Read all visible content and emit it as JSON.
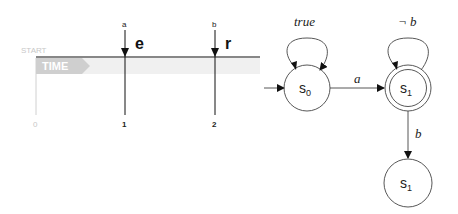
{
  "timeline": {
    "start_label": "START",
    "time_label": "TIME",
    "ticks": [
      {
        "label": "0",
        "x": 35
      },
      {
        "label": "1",
        "x": 125
      },
      {
        "label": "2",
        "x": 215
      }
    ],
    "events": [
      {
        "input": "a",
        "symbol": "e",
        "x": 125
      },
      {
        "input": "b",
        "symbol": "r",
        "x": 215
      }
    ],
    "colors": {
      "axis": "#111111",
      "faded": "#c8c8c8",
      "band": "#eeeeee"
    }
  },
  "automaton": {
    "states": [
      {
        "id": "s0",
        "label": "s",
        "sub": "0",
        "accepting": false,
        "initial": true
      },
      {
        "id": "s1",
        "label": "s",
        "sub": "1",
        "accepting": true,
        "initial": false
      },
      {
        "id": "s1b",
        "label": "s",
        "sub": "1",
        "accepting": false,
        "initial": false
      }
    ],
    "transitions": [
      {
        "from": "s0",
        "to": "s0",
        "label": "true"
      },
      {
        "from": "s0",
        "to": "s1",
        "label": "a"
      },
      {
        "from": "s1",
        "to": "s1",
        "label": "¬ b"
      },
      {
        "from": "s1",
        "to": "s1b",
        "label": "b"
      }
    ]
  }
}
